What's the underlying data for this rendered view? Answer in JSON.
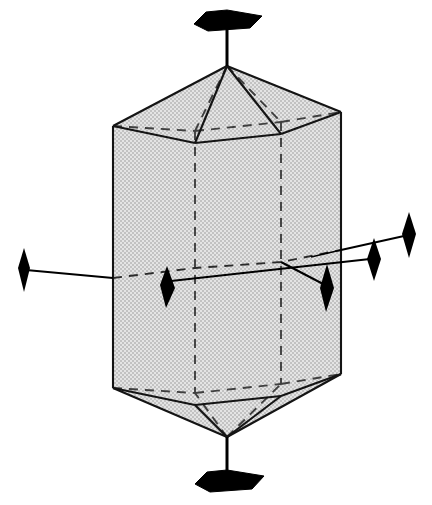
{
  "figure": {
    "type": "crystallographic-symmetry-diagram",
    "title": "Hexagonal dipyramid with symmetry axes",
    "canvas": {
      "width": 432,
      "height": 505
    },
    "background_color": "#ffffff"
  },
  "colors": {
    "body_fill": "#d2d2d2",
    "dither_light": "#e8e8e8",
    "dither_dark": "#b8b8b8",
    "edge_stroke": "#1a1a1a",
    "hidden_edge_stroke": "#3a3a3a",
    "axis_stroke": "#000000",
    "symbol_fill": "#000000"
  },
  "geometry": {
    "apex_top": {
      "x": 227,
      "y": 66
    },
    "apex_bottom": {
      "x": 227,
      "y": 437
    },
    "upper_ring": [
      {
        "name": "front-left",
        "x": 113,
        "y": 126
      },
      {
        "name": "front-mid",
        "x": 195,
        "y": 143
      },
      {
        "name": "front-right",
        "x": 281,
        "y": 134
      },
      {
        "name": "right",
        "x": 341,
        "y": 112
      },
      {
        "name": "back-right",
        "x": 281,
        "y": 122
      },
      {
        "name": "back-left",
        "x": 195,
        "y": 131
      }
    ],
    "lower_ring": [
      {
        "name": "front-left",
        "x": 113,
        "y": 388
      },
      {
        "name": "front-mid",
        "x": 195,
        "y": 405
      },
      {
        "name": "front-right",
        "x": 281,
        "y": 396
      },
      {
        "name": "right",
        "x": 341,
        "y": 374
      },
      {
        "name": "back-right",
        "x": 281,
        "y": 384
      },
      {
        "name": "back-left",
        "x": 195,
        "y": 393
      }
    ],
    "equator_left": {
      "x": 195,
      "y": 268
    },
    "equator_right": {
      "x": 281,
      "y": 262
    }
  },
  "axes": {
    "principal": {
      "label": "6-fold rotation axis",
      "order": 6,
      "symbol": "filled-hexagon",
      "orientation": "vertical",
      "top_marker": {
        "x": 227,
        "y": 22,
        "stem_from_y": 66
      },
      "bottom_marker": {
        "x": 227,
        "y": 480,
        "stem_from_y": 437
      }
    },
    "secondary": [
      {
        "label": "2-fold axis A",
        "order": 2,
        "symbol": "filled-lens",
        "from": {
          "x": 22,
          "y": 270
        },
        "to": {
          "x": 410,
          "y": 234
        },
        "markers": [
          {
            "x": 22,
            "y": 270,
            "size": "large"
          },
          {
            "x": 410,
            "y": 234,
            "size": "large"
          }
        ]
      },
      {
        "label": "2-fold axis B",
        "order": 2,
        "symbol": "filled-lens",
        "from": {
          "x": 168,
          "y": 286
        },
        "to": {
          "x": 374,
          "y": 259
        },
        "markers": [
          {
            "x": 168,
            "y": 286,
            "size": "small"
          },
          {
            "x": 374,
            "y": 259,
            "size": "small"
          }
        ]
      },
      {
        "label": "2-fold axis C",
        "order": 2,
        "symbol": "filled-lens",
        "from": {
          "x": 195,
          "y": 268
        },
        "to": {
          "x": 327,
          "y": 289
        },
        "markers": [
          {
            "x": 327,
            "y": 289,
            "size": "small"
          }
        ]
      }
    ]
  },
  "edges": {
    "solid_label": "visible edge",
    "dashed_label": "hidden edge",
    "dash_pattern": "9 7"
  }
}
